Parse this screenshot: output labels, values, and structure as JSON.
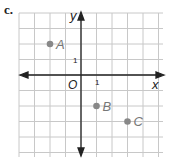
{
  "part_label": "c.",
  "axes": {
    "x_label": "x",
    "y_label": "y",
    "origin_label": "O",
    "x_tick": "1",
    "y_tick": "1"
  },
  "points": [
    {
      "name": "A",
      "x": -2,
      "y": 2
    },
    {
      "name": "B",
      "x": 1,
      "y": -2
    },
    {
      "name": "C",
      "x": 3,
      "y": -3
    }
  ],
  "colors": {
    "grid": "#c8c8c8",
    "axis": "#222222",
    "point": "#888888"
  }
}
